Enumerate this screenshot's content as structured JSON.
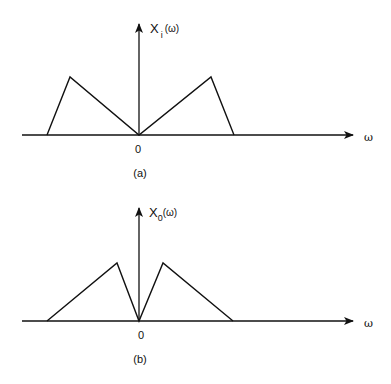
{
  "figures": [
    {
      "id": "a",
      "caption": "(a)",
      "y_label_main": "X",
      "y_label_sub": "i",
      "y_label_arg": "(ω)",
      "x_label": "ω",
      "origin_label": "0",
      "description": "Input spectrum: two triangles, peaks at outer edges, zero at origin",
      "polyline": [
        [
          47,
          135
        ],
        [
          70,
          77
        ],
        [
          139,
          135
        ],
        [
          211,
          77
        ],
        [
          234,
          135
        ]
      ]
    },
    {
      "id": "b",
      "caption": "(b)",
      "y_label_main": "X",
      "y_label_sub": "0",
      "y_label_arg": "(ω)",
      "x_label": "ω",
      "origin_label": "0",
      "description": "Output spectrum: two triangles, peaks near origin (inverted spectrum)",
      "polyline": [
        [
          47,
          321
        ],
        [
          117,
          263
        ],
        [
          139,
          321
        ],
        [
          163,
          263
        ],
        [
          233,
          321
        ]
      ]
    }
  ],
  "colors": {
    "line": "#111111",
    "background": "#ffffff"
  }
}
